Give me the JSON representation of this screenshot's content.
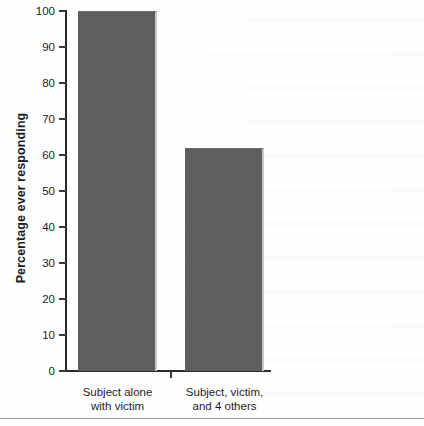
{
  "chart_data": {
    "type": "bar",
    "title": "",
    "subtitle": "",
    "xlabel": "",
    "ylabel": "Percentage ever responding",
    "categories": [
      "Subject alone with victim",
      "Subject, victim, and 4 others"
    ],
    "category_lines": [
      [
        "Subject alone",
        "with victim"
      ],
      [
        "Subject, victim,",
        "and 4 others"
      ]
    ],
    "values": [
      100,
      62
    ],
    "ylim": [
      0,
      100
    ],
    "yticks": [
      0,
      10,
      20,
      30,
      40,
      50,
      60,
      70,
      80,
      90,
      100
    ],
    "ytick_labels": [
      "0",
      "10",
      "20",
      "30",
      "40",
      "50",
      "60",
      "70",
      "80",
      "90",
      "100"
    ],
    "grid": false,
    "legend": null,
    "legend_position": "none",
    "bar_color": "#5e5e5e",
    "axis_color": "#2a2a2a",
    "background_color": "#fefefe"
  }
}
